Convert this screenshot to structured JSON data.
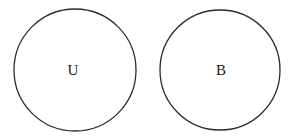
{
  "diagram": {
    "type": "disjoint-sets",
    "sets": [
      {
        "label": "U",
        "cx": 75,
        "cy": 70,
        "r": 61
      },
      {
        "label": "B",
        "cx": 220,
        "cy": 70,
        "r": 60
      }
    ],
    "stroke_color": "#2a2a2a",
    "background": "#ffffff"
  }
}
